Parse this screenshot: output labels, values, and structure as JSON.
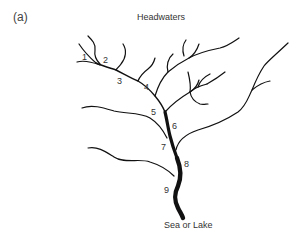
{
  "panel_label": "(a)",
  "top_label": "Headwaters",
  "bottom_label": "Sea or Lake",
  "segment_labels": [
    "1",
    "2",
    "3",
    "4",
    "5",
    "6",
    "7",
    "8",
    "9"
  ],
  "colors": {
    "stream": "#111111",
    "text": "#333333",
    "background": "#ffffff"
  }
}
